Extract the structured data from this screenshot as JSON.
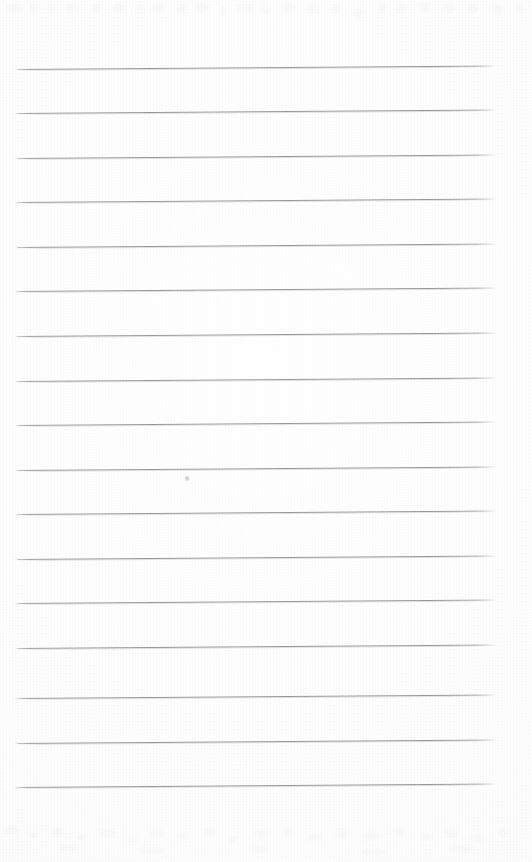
{
  "document": {
    "kind": "scanned-page",
    "description": "Blank ruled notebook page, scanned",
    "caption": "",
    "page_width": 532,
    "page_height": 862,
    "background_color": "#fdfdfd",
    "has_text": false,
    "text_content": ""
  },
  "ruling": {
    "line_color": "#96999 8",
    "line_color_hex": "#969998",
    "line_count": 17,
    "line_thickness": 1,
    "spacing": 45,
    "left_margin": 15,
    "right_margin": 35,
    "tilt_degrees": -0.42,
    "first_line_y": 69,
    "last_line_y": 787,
    "lines": [
      {
        "y": 69,
        "x": 15,
        "width": 481
      },
      {
        "y": 113,
        "x": 15,
        "width": 481
      },
      {
        "y": 158,
        "x": 15,
        "width": 481
      },
      {
        "y": 202,
        "x": 15,
        "width": 481
      },
      {
        "y": 247,
        "x": 15,
        "width": 481
      },
      {
        "y": 291,
        "x": 15,
        "width": 481
      },
      {
        "y": 336,
        "x": 15,
        "width": 481
      },
      {
        "y": 381,
        "x": 15,
        "width": 481
      },
      {
        "y": 425,
        "x": 15,
        "width": 481
      },
      {
        "y": 470,
        "x": 15,
        "width": 481
      },
      {
        "y": 514,
        "x": 15,
        "width": 481
      },
      {
        "y": 559,
        "x": 15,
        "width": 481
      },
      {
        "y": 603,
        "x": 15,
        "width": 481
      },
      {
        "y": 648,
        "x": 15,
        "width": 481
      },
      {
        "y": 698,
        "x": 15,
        "width": 481
      },
      {
        "y": 743,
        "x": 15,
        "width": 481
      },
      {
        "y": 787,
        "x": 15,
        "width": 481
      }
    ]
  },
  "marks": {
    "pen_mark": {
      "x": 185,
      "y": 476,
      "label": "faint pen smudge"
    }
  },
  "ghosting": {
    "note": "faint show-through from reverse side",
    "top": [
      {
        "x": 6,
        "y": 4,
        "w": 16,
        "h": 9
      },
      {
        "x": 30,
        "y": 2,
        "w": 10,
        "h": 11
      },
      {
        "x": 48,
        "y": 6,
        "w": 7,
        "h": 8
      },
      {
        "x": 66,
        "y": 3,
        "w": 12,
        "h": 10
      },
      {
        "x": 92,
        "y": 5,
        "w": 9,
        "h": 9
      },
      {
        "x": 112,
        "y": 2,
        "w": 14,
        "h": 12
      },
      {
        "x": 136,
        "y": 6,
        "w": 8,
        "h": 8
      },
      {
        "x": 152,
        "y": 3,
        "w": 11,
        "h": 10
      },
      {
        "x": 176,
        "y": 5,
        "w": 10,
        "h": 9
      },
      {
        "x": 196,
        "y": 2,
        "w": 13,
        "h": 11
      },
      {
        "x": 218,
        "y": 7,
        "w": 9,
        "h": 8
      },
      {
        "x": 238,
        "y": 3,
        "w": 15,
        "h": 10
      },
      {
        "x": 262,
        "y": 5,
        "w": 8,
        "h": 9
      },
      {
        "x": 284,
        "y": 2,
        "w": 12,
        "h": 12
      },
      {
        "x": 308,
        "y": 6,
        "w": 10,
        "h": 8
      },
      {
        "x": 332,
        "y": 4,
        "w": 9,
        "h": 10
      },
      {
        "x": 352,
        "y": 8,
        "w": 14,
        "h": 9
      },
      {
        "x": 378,
        "y": 3,
        "w": 8,
        "h": 11
      },
      {
        "x": 396,
        "y": 6,
        "w": 11,
        "h": 8
      },
      {
        "x": 420,
        "y": 2,
        "w": 9,
        "h": 10
      },
      {
        "x": 442,
        "y": 5,
        "w": 13,
        "h": 9
      },
      {
        "x": 468,
        "y": 3,
        "w": 10,
        "h": 11
      },
      {
        "x": 492,
        "y": 6,
        "w": 12,
        "h": 8
      },
      {
        "x": 514,
        "y": 4,
        "w": 9,
        "h": 10
      }
    ],
    "bottom": [
      {
        "x": 4,
        "y": 10,
        "w": 14,
        "h": 8
      },
      {
        "x": 28,
        "y": 16,
        "w": 10,
        "h": 7
      },
      {
        "x": 52,
        "y": 12,
        "w": 12,
        "h": 9
      },
      {
        "x": 78,
        "y": 18,
        "w": 9,
        "h": 7
      },
      {
        "x": 100,
        "y": 14,
        "w": 15,
        "h": 8
      },
      {
        "x": 128,
        "y": 20,
        "w": 8,
        "h": 7
      },
      {
        "x": 150,
        "y": 13,
        "w": 13,
        "h": 9
      },
      {
        "x": 178,
        "y": 17,
        "w": 10,
        "h": 7
      },
      {
        "x": 204,
        "y": 11,
        "w": 12,
        "h": 8
      },
      {
        "x": 230,
        "y": 19,
        "w": 9,
        "h": 7
      },
      {
        "x": 254,
        "y": 14,
        "w": 16,
        "h": 9
      },
      {
        "x": 284,
        "y": 12,
        "w": 10,
        "h": 8
      },
      {
        "x": 308,
        "y": 18,
        "w": 13,
        "h": 7
      },
      {
        "x": 336,
        "y": 13,
        "w": 11,
        "h": 9
      },
      {
        "x": 362,
        "y": 16,
        "w": 18,
        "h": 8
      },
      {
        "x": 392,
        "y": 11,
        "w": 12,
        "h": 9
      },
      {
        "x": 418,
        "y": 17,
        "w": 15,
        "h": 7
      },
      {
        "x": 446,
        "y": 13,
        "w": 11,
        "h": 9
      },
      {
        "x": 470,
        "y": 18,
        "w": 16,
        "h": 8
      },
      {
        "x": 498,
        "y": 12,
        "w": 12,
        "h": 9
      },
      {
        "x": 60,
        "y": 30,
        "w": 20,
        "h": 6
      },
      {
        "x": 140,
        "y": 32,
        "w": 24,
        "h": 6
      },
      {
        "x": 250,
        "y": 31,
        "w": 18,
        "h": 6
      },
      {
        "x": 360,
        "y": 33,
        "w": 26,
        "h": 6
      },
      {
        "x": 450,
        "y": 30,
        "w": 22,
        "h": 6
      }
    ]
  }
}
